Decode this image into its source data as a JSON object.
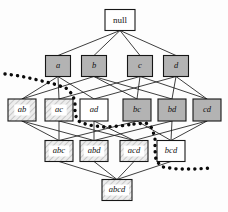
{
  "diagram": {
    "colors": {
      "background": "#fdfdfd",
      "node_stroke": "#161616",
      "edge_stroke": "#1b1b1b",
      "fill_white": "#ffffff",
      "fill_dark_grey": "#b3b3b3",
      "fill_light_hatch": "#e6e6e6",
      "hatch_stroke": "#9a9a9a",
      "boundary_dotted": "#0a0a0a"
    },
    "levels": [
      {
        "name": "level-0-empty",
        "y": 20
      },
      {
        "name": "level-1-singletons",
        "y": 66
      },
      {
        "name": "level-2-pairs",
        "y": 110
      },
      {
        "name": "level-3-triples",
        "y": 151
      },
      {
        "name": "level-4-full",
        "y": 190
      }
    ],
    "nodes": [
      {
        "id": "null",
        "label": "null",
        "cx": 120,
        "cy": 20,
        "w": 30,
        "h": 21,
        "fill": "white",
        "style": "plain"
      },
      {
        "id": "a",
        "label": "a",
        "cx": 58,
        "cy": 66,
        "w": 25,
        "h": 21,
        "fill": "dark"
      },
      {
        "id": "b",
        "label": "b",
        "cx": 94,
        "cy": 66,
        "w": 25,
        "h": 21,
        "fill": "dark"
      },
      {
        "id": "c",
        "label": "c",
        "cx": 140,
        "cy": 66,
        "w": 25,
        "h": 21,
        "fill": "dark"
      },
      {
        "id": "d",
        "label": "d",
        "cx": 176,
        "cy": 66,
        "w": 25,
        "h": 21,
        "fill": "dark"
      },
      {
        "id": "ab",
        "label": "ab",
        "cx": 22,
        "cy": 110,
        "w": 28,
        "h": 22,
        "fill": "hatch"
      },
      {
        "id": "ac",
        "label": "ac",
        "cx": 59,
        "cy": 110,
        "w": 28,
        "h": 22,
        "fill": "hatch"
      },
      {
        "id": "ad",
        "label": "ad",
        "cx": 94,
        "cy": 110,
        "w": 28,
        "h": 22,
        "fill": "white"
      },
      {
        "id": "bc",
        "label": "bc",
        "cx": 137,
        "cy": 110,
        "w": 28,
        "h": 22,
        "fill": "dark"
      },
      {
        "id": "bd",
        "label": "bd",
        "cx": 172,
        "cy": 110,
        "w": 28,
        "h": 22,
        "fill": "dark"
      },
      {
        "id": "cd",
        "label": "cd",
        "cx": 207,
        "cy": 110,
        "w": 28,
        "h": 22,
        "fill": "dark"
      },
      {
        "id": "abc",
        "label": "abc",
        "cx": 59,
        "cy": 151,
        "w": 28,
        "h": 21,
        "fill": "hatch"
      },
      {
        "id": "abd",
        "label": "abd",
        "cx": 94,
        "cy": 151,
        "w": 28,
        "h": 21,
        "fill": "hatch"
      },
      {
        "id": "acd",
        "label": "acd",
        "cx": 134,
        "cy": 151,
        "w": 28,
        "h": 21,
        "fill": "hatch"
      },
      {
        "id": "bcd",
        "label": "bcd",
        "cx": 171,
        "cy": 151,
        "w": 28,
        "h": 21,
        "fill": "white"
      },
      {
        "id": "abcd",
        "label": "abcd",
        "cx": 117,
        "cy": 190,
        "w": 30,
        "h": 21,
        "fill": "hatch"
      }
    ],
    "edges": [
      {
        "from": "null",
        "to": "a"
      },
      {
        "from": "null",
        "to": "b"
      },
      {
        "from": "null",
        "to": "c"
      },
      {
        "from": "null",
        "to": "d"
      },
      {
        "from": "a",
        "to": "ab"
      },
      {
        "from": "a",
        "to": "ac"
      },
      {
        "from": "a",
        "to": "ad"
      },
      {
        "from": "b",
        "to": "ab"
      },
      {
        "from": "b",
        "to": "bc"
      },
      {
        "from": "b",
        "to": "bd"
      },
      {
        "from": "c",
        "to": "ac"
      },
      {
        "from": "c",
        "to": "bc"
      },
      {
        "from": "c",
        "to": "cd"
      },
      {
        "from": "d",
        "to": "ad"
      },
      {
        "from": "d",
        "to": "bd"
      },
      {
        "from": "d",
        "to": "cd"
      },
      {
        "from": "ab",
        "to": "abc"
      },
      {
        "from": "ab",
        "to": "abd"
      },
      {
        "from": "ac",
        "to": "abc"
      },
      {
        "from": "ac",
        "to": "acd"
      },
      {
        "from": "ad",
        "to": "abd"
      },
      {
        "from": "ad",
        "to": "acd"
      },
      {
        "from": "bc",
        "to": "abc"
      },
      {
        "from": "bc",
        "to": "bcd"
      },
      {
        "from": "bd",
        "to": "abd"
      },
      {
        "from": "bd",
        "to": "bcd"
      },
      {
        "from": "cd",
        "to": "acd"
      },
      {
        "from": "cd",
        "to": "bcd"
      },
      {
        "from": "abc",
        "to": "abcd"
      },
      {
        "from": "abd",
        "to": "abcd"
      },
      {
        "from": "acd",
        "to": "abcd"
      },
      {
        "from": "bcd",
        "to": "abcd"
      }
    ],
    "boundaries": [
      {
        "name": "boundary-left",
        "points": "5,74 20,76 38,80 54,84 66,88 73,95 75,104 75,114 78,121 88,125 104,127 120,126 134,124"
      },
      {
        "name": "boundary-right",
        "points": "134,124 146,123 152,128 155,138 155,150 156,161 163,167 177,169 194,169 212,168"
      }
    ]
  }
}
